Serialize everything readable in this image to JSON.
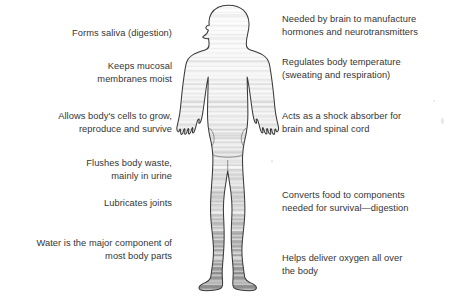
{
  "diagram": {
    "figure": {
      "name": "human-body-silhouette",
      "description": "Outlined human figure filled with horizontal water-like striations that darken toward the feet",
      "outline_color": "#3a3a3a",
      "fill_light": "#f4f4f4",
      "fill_mid": "#d8d8d8",
      "fill_dark": "#8e8e8e"
    },
    "left_labels": [
      {
        "id": "forms-saliva",
        "text": "Forms saliva (digestion)"
      },
      {
        "id": "keeps-mucosal",
        "text": "Keeps mucosal\nmembranes moist"
      },
      {
        "id": "cells-grow",
        "text": "Allows body's cells to grow,\nreproduce and survive"
      },
      {
        "id": "flushes-waste",
        "text": "Flushes body waste,\nmainly in urine"
      },
      {
        "id": "lubricates-joints",
        "text": "Lubricates joints"
      },
      {
        "id": "major-component",
        "text": "Water is the major component of\nmost body parts"
      }
    ],
    "right_labels": [
      {
        "id": "brain-hormones",
        "text": "Needed by brain to manufacture\nhormones and neurotransmitters"
      },
      {
        "id": "body-temperature",
        "text": "Regulates body temperature\n(sweating and respiration)"
      },
      {
        "id": "shock-absorber",
        "text": "Acts as a shock absorber for\nbrain and spinal cord"
      },
      {
        "id": "converts-food",
        "text": "Converts food to components\nneeded for survival—digestion"
      },
      {
        "id": "delivers-oxygen",
        "text": "Helps deliver oxygen all over\nthe body"
      }
    ],
    "colors": {
      "background": "#ffffff",
      "text": "#343434",
      "outline": "#3a3a3a"
    }
  }
}
